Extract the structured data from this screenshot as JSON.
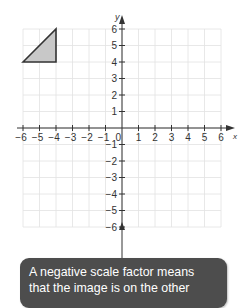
{
  "chart_data": {
    "type": "diagram",
    "title": "",
    "xlabel": "x",
    "ylabel": "y",
    "xlim": [
      -6,
      6
    ],
    "ylim": [
      -6,
      6
    ],
    "grid": true,
    "x_ticks": [
      "-6",
      "-5",
      "-4",
      "-3",
      "-2",
      "-1",
      "1",
      "2",
      "3",
      "4",
      "5",
      "6"
    ],
    "y_ticks": [
      "6",
      "5",
      "4",
      "3",
      "2",
      "1",
      "-1",
      "-2",
      "-3",
      "-4",
      "-5",
      "-6"
    ],
    "origin_label": "0",
    "shapes": [
      {
        "type": "triangle",
        "vertices": [
          [
            -6,
            4
          ],
          [
            -4,
            6
          ],
          [
            -4,
            4
          ]
        ],
        "fill": "#c8c8c8",
        "stroke": "#333333"
      }
    ]
  },
  "callout": {
    "lines": [
      "A negative scale factor means",
      "that the image is on the other"
    ],
    "background": "#4d4d4d",
    "text_color": "#ffffff"
  }
}
